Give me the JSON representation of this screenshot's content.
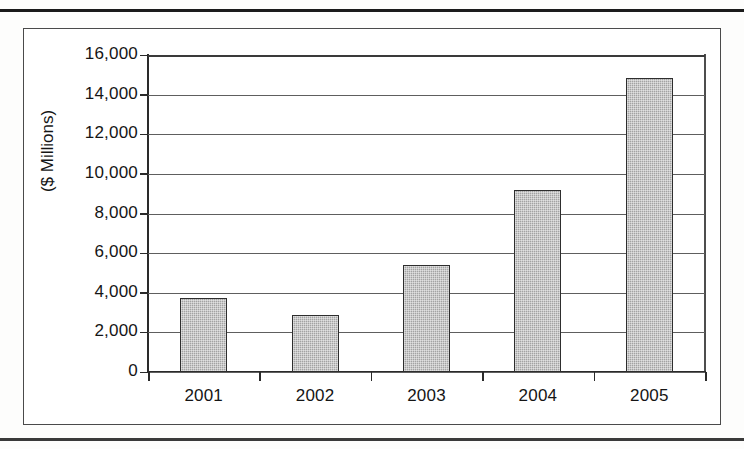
{
  "chart_data": {
    "type": "bar",
    "title": "",
    "xlabel": "",
    "ylabel": "($ Millions)",
    "categories": [
      "2001",
      "2002",
      "2003",
      "2004",
      "2005"
    ],
    "values": [
      3750,
      2900,
      5400,
      9200,
      14850
    ],
    "ylim": [
      0,
      16000
    ],
    "ytick_values": [
      0,
      2000,
      4000,
      6000,
      8000,
      10000,
      12000,
      14000,
      16000
    ],
    "ytick_labels": [
      "0",
      "2,000",
      "4,000",
      "6,000",
      "8,000",
      "10,000",
      "12,000",
      "14,000",
      "16,000"
    ],
    "grid": true,
    "grid_axis": "y",
    "legend": false,
    "legend_position": "none",
    "bar_color": "#a3a3a3",
    "bar_edge_color": "#2e2e2e",
    "axis_color": "#2a2a2a",
    "grid_color": "#5e5e5e",
    "text_color": "#151515",
    "background_color": "#ffffff"
  },
  "figure": {
    "frame_border_color": "#4a4a4a",
    "page_rule_color": "#1b1b1b"
  }
}
